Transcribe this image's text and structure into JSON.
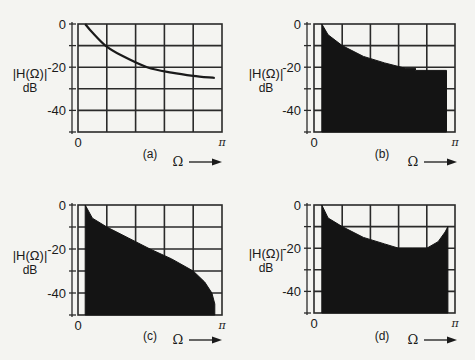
{
  "chart_data": [
    {
      "id": "a",
      "type": "line",
      "caption": "(a)",
      "title": "",
      "xlabel": "Ω",
      "ylabel": "|H(Ω)| dB",
      "ylabel_top": "|H(Ω)|",
      "ylabel_bottom": "dB",
      "x_tick_labels": [
        "0",
        "π"
      ],
      "y_tick_labels": [
        "0",
        "-20",
        "-40"
      ],
      "ylim": [
        -50,
        0
      ],
      "xlim": [
        0,
        1
      ],
      "x_unit": "π",
      "grid": true,
      "grid_cols": 5,
      "grid_rows": 5,
      "filled": false,
      "x": [
        0.05,
        0.1,
        0.19,
        0.3,
        0.48,
        0.65,
        0.8,
        0.95
      ],
      "values": [
        0,
        -4,
        -10,
        -14.5,
        -20,
        -22.5,
        -24,
        -25
      ]
    },
    {
      "id": "b",
      "type": "area",
      "caption": "(b)",
      "title": "",
      "xlabel": "Ω",
      "ylabel": "|H(Ω)| dB",
      "ylabel_top": "|H(Ω)|",
      "ylabel_bottom": "dB",
      "x_tick_labels": [
        "0",
        "π"
      ],
      "y_tick_labels": [
        "0",
        "-20",
        "-40"
      ],
      "ylim": [
        -50,
        0
      ],
      "xlim": [
        0,
        1
      ],
      "x_unit": "π",
      "grid": true,
      "grid_cols": 5,
      "grid_rows": 5,
      "filled": true,
      "x": [
        0.055,
        0.1,
        0.2,
        0.35,
        0.5,
        0.65,
        0.72,
        0.72,
        0.94
      ],
      "values": [
        0,
        -5,
        -10,
        -15,
        -18,
        -20.5,
        -20.5,
        -21.5,
        -21.5
      ]
    },
    {
      "id": "c",
      "type": "area",
      "caption": "(c)",
      "title": "",
      "xlabel": "Ω",
      "ylabel": "|H(Ω)| dB",
      "ylabel_top": "|H(Ω)|",
      "ylabel_bottom": "dB",
      "x_tick_labels": [
        "0",
        "π"
      ],
      "y_tick_labels": [
        "0",
        "-20",
        "-40"
      ],
      "ylim": [
        -50,
        0
      ],
      "xlim": [
        0,
        1
      ],
      "x_unit": "π",
      "grid": true,
      "grid_cols": 5,
      "grid_rows": 5,
      "filled": true,
      "x": [
        0.05,
        0.1,
        0.2,
        0.35,
        0.5,
        0.65,
        0.8,
        0.88,
        0.93,
        0.95
      ],
      "values": [
        0,
        -6,
        -10,
        -15,
        -20,
        -24.5,
        -30,
        -35,
        -40,
        -45
      ]
    },
    {
      "id": "d",
      "type": "area",
      "caption": "(d)",
      "title": "",
      "xlabel": "Ω",
      "ylabel": "|H(Ω)| dB",
      "ylabel_top": "|H(Ω)|",
      "ylabel_bottom": "dB",
      "x_tick_labels": [
        "0",
        "π"
      ],
      "y_tick_labels": [
        "0",
        "-20",
        "-40"
      ],
      "ylim": [
        -50,
        0
      ],
      "xlim": [
        0,
        1
      ],
      "x_unit": "π",
      "grid": true,
      "grid_cols": 5,
      "grid_rows": 5,
      "filled": true,
      "x": [
        0.055,
        0.1,
        0.2,
        0.35,
        0.5,
        0.6,
        0.7,
        0.8,
        0.88,
        0.93,
        0.95
      ],
      "values": [
        0,
        -6,
        -10,
        -15,
        -18,
        -20,
        -20,
        -20,
        -17,
        -12.5,
        -10
      ]
    }
  ]
}
